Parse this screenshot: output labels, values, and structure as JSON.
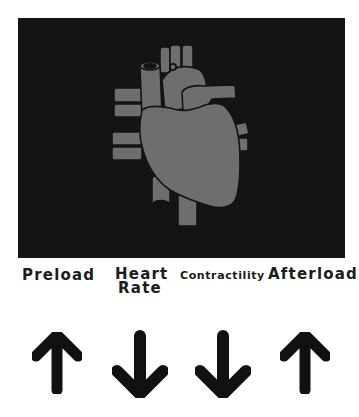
{
  "figure": {
    "image": {
      "subject": "heart-icon",
      "background": "#141414",
      "fill": "#6e6e6e",
      "outline": "#141414"
    },
    "factors": [
      {
        "label": "Preload",
        "direction": "up",
        "icon": "arrow-up-icon"
      },
      {
        "label_line1": "Heart",
        "label_line2": "Rate",
        "direction": "down",
        "icon": "arrow-down-icon"
      },
      {
        "label": "Contractility",
        "direction": "down",
        "icon": "arrow-down-icon"
      },
      {
        "label": "Afterload",
        "direction": "up",
        "icon": "arrow-up-icon"
      }
    ],
    "arrow_color": "#111111"
  }
}
